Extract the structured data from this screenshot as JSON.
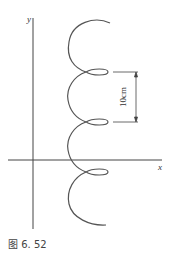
{
  "figure": {
    "caption": "图 6. 52",
    "axes": {
      "x_label": "x",
      "y_label": "y"
    },
    "dimension": {
      "label": "10cm"
    },
    "curve": {
      "description": "helical spiral path (trochoid) with three small loops, viewed from side",
      "loop_count": 3,
      "stroke_color": "#555555"
    },
    "colors": {
      "line": "#555555",
      "background": "#ffffff"
    }
  }
}
